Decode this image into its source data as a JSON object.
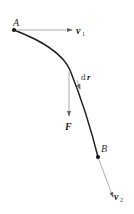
{
  "diagram": {
    "labels": {
      "point_a": "A",
      "point_b": "B",
      "v1": "v",
      "v1_sub": "1",
      "v2": "v",
      "v2_sub": "2",
      "dr_d": "d",
      "dr_r": "r",
      "force": "F"
    },
    "colors": {
      "curve": "#222222",
      "arrow": "#888888",
      "background": "#ffffff"
    }
  }
}
